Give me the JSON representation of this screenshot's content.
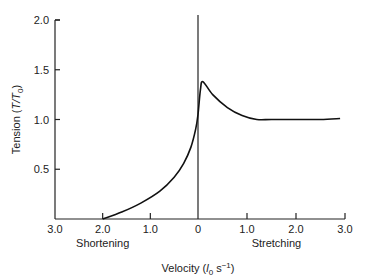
{
  "chart_data": {
    "type": "line",
    "title": "",
    "xlabel": "Velocity (l0 s−1)",
    "xlabel_parts": {
      "prefix": "Velocity (",
      "italic": "l",
      "sub": "0",
      "unit": " s",
      "sup": "−1",
      "suffix": ")"
    },
    "ylabel": "Tension (T/T0)",
    "ylabel_parts": {
      "prefix": "Tension (",
      "italic": "T/T",
      "sub": "0",
      "suffix": ")"
    },
    "xlim": [
      -3.0,
      3.0
    ],
    "ylim": [
      0,
      2.0
    ],
    "x_ticks": [
      {
        "value": -3.0,
        "label": "3.0"
      },
      {
        "value": -2.0,
        "label": "2.0"
      },
      {
        "value": -1.0,
        "label": "1.0"
      },
      {
        "value": 0,
        "label": "0"
      },
      {
        "value": 1.0,
        "label": "1.0"
      },
      {
        "value": 2.0,
        "label": "2.0"
      },
      {
        "value": 3.0,
        "label": "3.0"
      }
    ],
    "y_ticks": [
      {
        "value": 0.5,
        "label": "0.5"
      },
      {
        "value": 1.0,
        "label": "1.0"
      },
      {
        "value": 1.5,
        "label": "1.5"
      },
      {
        "value": 2.0,
        "label": "2.0"
      }
    ],
    "region_labels": [
      {
        "text": "Shortening",
        "x": -2.0
      },
      {
        "text": "Stretching",
        "x": 1.6
      }
    ],
    "grid": false,
    "series": [
      {
        "name": "force-velocity",
        "x": [
          -2.0,
          -1.6,
          -1.2,
          -0.8,
          -0.5,
          -0.3,
          -0.15,
          -0.05,
          0,
          0.05,
          0.1,
          0.3,
          0.6,
          0.9,
          1.2,
          1.5,
          2.0,
          2.5,
          2.9
        ],
        "y": [
          0.0,
          0.07,
          0.16,
          0.28,
          0.42,
          0.56,
          0.72,
          0.9,
          1.05,
          1.3,
          1.38,
          1.25,
          1.12,
          1.04,
          1.0,
          1.0,
          1.0,
          1.0,
          1.01
        ]
      }
    ]
  }
}
